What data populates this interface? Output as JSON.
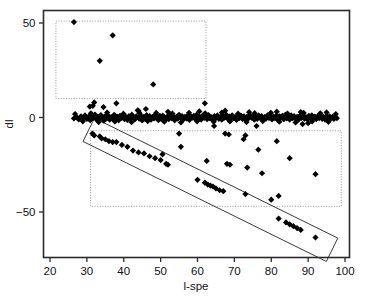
{
  "chart_data": {
    "type": "scatter",
    "title": "",
    "xlabel": "l-spe",
    "ylabel": "dl",
    "xlim": [
      20,
      100
    ],
    "ylim": [
      -68,
      57
    ],
    "xticks": [
      20,
      30,
      40,
      50,
      60,
      70,
      80,
      90,
      100
    ],
    "xtick_labels": [
      "20",
      "30",
      "40",
      "50",
      "60",
      "70",
      "80",
      "90",
      "100"
    ],
    "yticks": [
      50,
      0,
      -50
    ],
    "ytick_labels": [
      "50",
      "0",
      "-50"
    ],
    "grid": false,
    "legend": "none",
    "marker": "filled-diamond",
    "marker_color": "#000000",
    "frame_color": "#2b2b2b",
    "annotation_color": "#9a9a9a",
    "annotations": [
      {
        "name": "upper-outlier-box",
        "shape": "dotted-rectangle",
        "x_range": [
          21.6,
          62.3
        ],
        "y_range": [
          10,
          51
        ]
      },
      {
        "name": "lower-outlier-box",
        "shape": "dotted-rectangle",
        "x_range": [
          31.0,
          99.0
        ],
        "y_range": [
          -47,
          -7
        ]
      },
      {
        "name": "diagonal-trend-band",
        "shape": "rotated-rectangle",
        "from": [
          30.5,
          -6.5
        ],
        "to": [
          96.5,
          -70.0
        ]
      }
    ],
    "series": [
      {
        "name": "upper outliers",
        "points": [
          [
            26.5,
            50.5
          ],
          [
            37.0,
            43.5
          ],
          [
            33.5,
            30.0
          ],
          [
            48.0,
            17.5
          ]
        ]
      },
      {
        "name": "near-zero band",
        "points": [
          [
            26.5,
            -0.5
          ],
          [
            27.2,
            0.2
          ],
          [
            27.8,
            -1.0
          ],
          [
            28.4,
            0.6
          ],
          [
            29.0,
            -0.3
          ],
          [
            29.5,
            1.1
          ],
          [
            30.0,
            -0.8
          ],
          [
            30.4,
            0.4
          ],
          [
            30.9,
            -1.4
          ],
          [
            31.3,
            0.9
          ],
          [
            31.7,
            -0.2
          ],
          [
            32.0,
            8.0
          ],
          [
            32.2,
            1.6
          ],
          [
            32.6,
            -1.1
          ],
          [
            33.0,
            0.3
          ],
          [
            33.4,
            -0.6
          ],
          [
            33.8,
            1.3
          ],
          [
            34.2,
            -0.1
          ],
          [
            34.6,
            -1.7
          ],
          [
            35.0,
            0.8
          ],
          [
            35.4,
            -0.4
          ],
          [
            35.8,
            1.0
          ],
          [
            36.2,
            -1.2
          ],
          [
            36.6,
            0.1
          ],
          [
            37.0,
            -0.7
          ],
          [
            37.4,
            1.4
          ],
          [
            37.8,
            -0.3
          ],
          [
            38.0,
            7.5
          ],
          [
            38.2,
            0.5
          ],
          [
            38.6,
            -1.5
          ],
          [
            39.0,
            0.9
          ],
          [
            39.4,
            -0.2
          ],
          [
            39.8,
            1.2
          ],
          [
            40.2,
            -0.9
          ],
          [
            40.6,
            0.3
          ],
          [
            41.0,
            -1.3
          ],
          [
            41.4,
            0.7
          ],
          [
            41.8,
            -0.4
          ],
          [
            42.2,
            1.5
          ],
          [
            42.6,
            -0.1
          ],
          [
            43.0,
            -1.0
          ],
          [
            43.4,
            0.6
          ],
          [
            43.8,
            3.8
          ],
          [
            44.2,
            -0.6
          ],
          [
            44.6,
            1.1
          ],
          [
            45.0,
            -1.6
          ],
          [
            45.4,
            0.2
          ],
          [
            45.8,
            -0.8
          ],
          [
            46.0,
            4.5
          ],
          [
            46.2,
            1.3
          ],
          [
            46.6,
            -0.3
          ],
          [
            47.0,
            0.8
          ],
          [
            47.4,
            -1.1
          ],
          [
            47.8,
            0.4
          ],
          [
            48.2,
            -0.5
          ],
          [
            48.6,
            1.6
          ],
          [
            49.0,
            -0.2
          ],
          [
            49.4,
            -1.4
          ],
          [
            49.8,
            0.9
          ],
          [
            50.2,
            -0.7
          ],
          [
            50.6,
            1.0
          ],
          [
            51.0,
            -0.1
          ],
          [
            51.4,
            -1.2
          ],
          [
            51.8,
            0.5
          ],
          [
            52.2,
            -0.9
          ],
          [
            52.6,
            1.3
          ],
          [
            53.0,
            -0.3
          ],
          [
            53.4,
            0.7
          ],
          [
            53.8,
            -1.5
          ],
          [
            54.2,
            0.2
          ],
          [
            54.6,
            -0.6
          ],
          [
            55.0,
            1.4
          ],
          [
            55.4,
            -0.2
          ],
          [
            55.8,
            0.8
          ],
          [
            56.2,
            -1.0
          ],
          [
            56.6,
            0.4
          ],
          [
            57.0,
            -0.5
          ],
          [
            57.4,
            1.2
          ],
          [
            57.8,
            -1.3
          ],
          [
            58.2,
            0.6
          ],
          [
            58.6,
            -0.1
          ],
          [
            59.0,
            0.9
          ],
          [
            59.4,
            -0.8
          ],
          [
            59.8,
            1.5
          ],
          [
            60.2,
            -0.4
          ],
          [
            60.6,
            0.3
          ],
          [
            61.0,
            -1.1
          ],
          [
            61.4,
            1.0
          ],
          [
            61.8,
            -0.2
          ],
          [
            62.0,
            7.5
          ],
          [
            62.2,
            0.7
          ],
          [
            62.6,
            -0.9
          ],
          [
            63.0,
            1.3
          ],
          [
            63.4,
            -0.5
          ],
          [
            63.8,
            0.1
          ],
          [
            64.2,
            -1.4
          ],
          [
            64.6,
            0.8
          ],
          [
            65.0,
            -0.3
          ],
          [
            65.4,
            1.1
          ],
          [
            65.8,
            -0.7
          ],
          [
            66.2,
            0.4
          ],
          [
            66.6,
            -1.2
          ],
          [
            67.0,
            0.9
          ],
          [
            67.4,
            -0.1
          ],
          [
            67.8,
            1.4
          ],
          [
            68.2,
            -0.6
          ],
          [
            68.6,
            0.5
          ],
          [
            69.0,
            -1.0
          ],
          [
            69.4,
            1.2
          ],
          [
            69.8,
            -0.4
          ],
          [
            70.2,
            0.2
          ],
          [
            70.6,
            -1.3
          ],
          [
            71.0,
            0.8
          ],
          [
            71.4,
            -0.2
          ],
          [
            71.8,
            1.0
          ],
          [
            72.2,
            -0.8
          ],
          [
            72.6,
            0.6
          ],
          [
            73.0,
            -1.1
          ],
          [
            73.4,
            0.3
          ],
          [
            73.8,
            -0.5
          ],
          [
            74.2,
            1.3
          ],
          [
            74.6,
            -0.1
          ],
          [
            75.0,
            0.9
          ],
          [
            75.4,
            -1.2
          ],
          [
            75.8,
            0.4
          ],
          [
            76.2,
            -0.7
          ],
          [
            76.6,
            1.1
          ],
          [
            77.0,
            -0.3
          ],
          [
            77.4,
            0.7
          ],
          [
            77.8,
            -1.4
          ],
          [
            78.2,
            0.2
          ],
          [
            78.6,
            -0.6
          ],
          [
            79.0,
            1.2
          ],
          [
            79.4,
            -0.2
          ],
          [
            79.8,
            0.8
          ],
          [
            80.2,
            -1.0
          ],
          [
            80.6,
            0.5
          ],
          [
            81.0,
            -0.4
          ],
          [
            81.4,
            1.0
          ],
          [
            81.8,
            -1.3
          ],
          [
            82.2,
            0.6
          ],
          [
            82.6,
            -0.1
          ],
          [
            83.0,
            0.9
          ],
          [
            83.4,
            -0.9
          ],
          [
            83.8,
            1.4
          ],
          [
            84.2,
            -0.5
          ],
          [
            84.6,
            0.3
          ],
          [
            85.0,
            -1.1
          ],
          [
            85.4,
            1.1
          ],
          [
            85.8,
            -0.3
          ],
          [
            86.2,
            0.7
          ],
          [
            86.6,
            -0.8
          ],
          [
            87.0,
            0.4
          ],
          [
            87.4,
            -1.2
          ],
          [
            87.8,
            1.0
          ],
          [
            88.2,
            -0.2
          ],
          [
            88.6,
            0.8
          ],
          [
            89.0,
            -0.6
          ],
          [
            89.4,
            0.2
          ],
          [
            89.8,
            -1.0
          ],
          [
            90.2,
            0.9
          ],
          [
            90.6,
            -0.4
          ],
          [
            91.0,
            1.2
          ],
          [
            91.4,
            -0.1
          ],
          [
            91.8,
            0.5
          ],
          [
            92.2,
            -0.9
          ],
          [
            92.6,
            0.7
          ],
          [
            93.0,
            -0.3
          ],
          [
            93.4,
            1.0
          ],
          [
            93.8,
            -0.7
          ],
          [
            94.2,
            0.3
          ],
          [
            94.6,
            -1.1
          ],
          [
            95.0,
            0.8
          ],
          [
            95.4,
            -0.2
          ],
          [
            95.8,
            0.6
          ],
          [
            96.2,
            -0.5
          ],
          [
            96.6,
            0.4
          ],
          [
            97.0,
            -0.8
          ],
          [
            97.4,
            0.2
          ],
          [
            97.8,
            -0.4
          ],
          [
            26.8,
            1.8
          ],
          [
            28.9,
            -2.0
          ],
          [
            31.1,
            2.2
          ],
          [
            33.2,
            -2.4
          ],
          [
            35.5,
            2.6
          ],
          [
            37.6,
            -2.1
          ],
          [
            39.9,
            2.0
          ],
          [
            42.1,
            -2.5
          ],
          [
            44.3,
            2.3
          ],
          [
            46.5,
            -1.9
          ],
          [
            48.8,
            2.4
          ],
          [
            51.0,
            -2.2
          ],
          [
            53.2,
            2.1
          ],
          [
            55.5,
            -2.6
          ],
          [
            57.7,
            2.5
          ],
          [
            59.9,
            -2.0
          ],
          [
            62.1,
            2.2
          ],
          [
            64.4,
            -2.3
          ],
          [
            66.6,
            2.6
          ],
          [
            68.8,
            -2.1
          ],
          [
            71.0,
            2.0
          ],
          [
            73.3,
            -2.4
          ],
          [
            75.5,
            2.3
          ],
          [
            77.7,
            -1.9
          ],
          [
            79.9,
            2.5
          ],
          [
            82.2,
            -2.2
          ],
          [
            84.4,
            2.1
          ],
          [
            86.6,
            -2.6
          ],
          [
            88.8,
            2.4
          ],
          [
            91.1,
            -2.0
          ],
          [
            93.3,
            2.2
          ],
          [
            95.5,
            -2.3
          ],
          [
            97.5,
            1.8
          ],
          [
            34.5,
            5.5
          ],
          [
            44.0,
            3.5
          ],
          [
            52.0,
            3.0
          ],
          [
            60.5,
            3.2
          ],
          [
            67.5,
            3.6
          ],
          [
            74.0,
            2.8
          ],
          [
            81.5,
            3.1
          ],
          [
            88.0,
            2.9
          ],
          [
            95.0,
            2.7
          ],
          [
            30.8,
            5.8
          ],
          [
            31.6,
            6.2
          ]
        ]
      },
      {
        "name": "lower scattered outliers",
        "points": [
          [
            55.0,
            -8.5
          ],
          [
            67.5,
            -8.5
          ],
          [
            68.5,
            -9.0
          ],
          [
            73.0,
            -9.5
          ],
          [
            64.5,
            -4.5
          ],
          [
            76.0,
            -4.5
          ],
          [
            88.5,
            -3.5
          ],
          [
            90.0,
            -3.0
          ],
          [
            55.5,
            -15.5
          ],
          [
            76.5,
            -17.0
          ],
          [
            81.5,
            -12.5
          ],
          [
            62.5,
            -23.0
          ],
          [
            68.0,
            -24.5
          ],
          [
            68.8,
            -25.0
          ],
          [
            73.5,
            -26.5
          ],
          [
            77.5,
            -29.5
          ],
          [
            85.0,
            -21.5
          ],
          [
            92.0,
            -30.0
          ],
          [
            73.0,
            -40.5
          ],
          [
            80.0,
            -43.5
          ],
          [
            82.0,
            -41.5
          ],
          [
            72.5,
            -11.5
          ],
          [
            50.5,
            -19.5
          ]
        ]
      },
      {
        "name": "diagonal trend points",
        "points": [
          [
            31.5,
            -8.5
          ],
          [
            32.0,
            -9.5
          ],
          [
            33.5,
            -10.0
          ],
          [
            34.0,
            -11.0
          ],
          [
            35.0,
            -11.5
          ],
          [
            36.0,
            -12.5
          ],
          [
            37.0,
            -13.0
          ],
          [
            38.0,
            -13.0
          ],
          [
            39.5,
            -14.5
          ],
          [
            41.0,
            -15.5
          ],
          [
            42.5,
            -17.5
          ],
          [
            44.0,
            -18.5
          ],
          [
            45.5,
            -19.0
          ],
          [
            47.0,
            -20.5
          ],
          [
            48.5,
            -21.5
          ],
          [
            50.0,
            -22.5
          ],
          [
            51.5,
            -24.5
          ],
          [
            52.0,
            -25.0
          ],
          [
            60.0,
            -33.0
          ],
          [
            62.0,
            -34.5
          ],
          [
            62.8,
            -35.5
          ],
          [
            63.5,
            -36.0
          ],
          [
            64.2,
            -36.5
          ],
          [
            65.0,
            -37.5
          ],
          [
            66.0,
            -38.5
          ],
          [
            67.0,
            -39.0
          ],
          [
            82.0,
            -53.5
          ],
          [
            84.0,
            -55.5
          ],
          [
            85.0,
            -56.5
          ],
          [
            86.0,
            -57.5
          ],
          [
            87.0,
            -58.5
          ],
          [
            88.0,
            -59.5
          ],
          [
            92.0,
            -63.5
          ]
        ]
      }
    ]
  },
  "axes": {
    "x_title": "l-spe",
    "y_title": "dl"
  }
}
